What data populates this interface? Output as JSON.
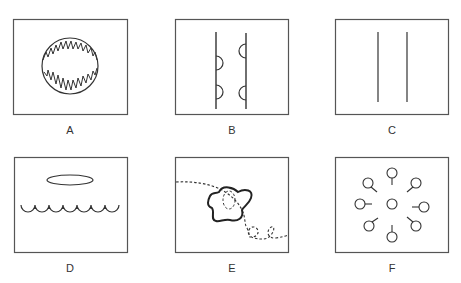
{
  "figure": {
    "panels": [
      {
        "id": "A",
        "label": "A",
        "description": "circle with jagged (serrated) inner edge"
      },
      {
        "id": "B",
        "label": "B",
        "description": "two vertical lines with semicircular bulges"
      },
      {
        "id": "C",
        "label": "C",
        "description": "two parallel vertical lines"
      },
      {
        "id": "D",
        "label": "D",
        "description": "ellipse above a scalloped wavy line"
      },
      {
        "id": "E",
        "label": "E",
        "description": "amoeboid blob with dashed trajectory path"
      },
      {
        "id": "F",
        "label": "F",
        "description": "central circle surrounded by eight circles with radial stalks"
      }
    ],
    "colors": {
      "stroke": "#333333",
      "border": "#555555",
      "background": "#ffffff"
    }
  }
}
